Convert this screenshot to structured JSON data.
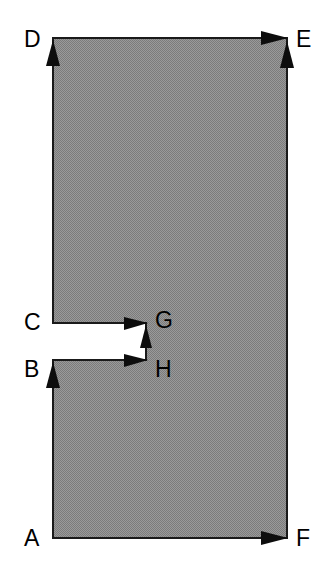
{
  "figure": {
    "type": "geometry-diagram",
    "canvas": {
      "width": 333,
      "height": 573
    },
    "colors": {
      "fill": "#8c8c8c",
      "stroke": "#1a1a1a",
      "background": "#ffffff",
      "label": "#000000"
    },
    "stroke_width": 2,
    "outline": {
      "description": "Rectangle A-D-E-F with a rectangular notch cut into the left side between C and B, reaching rightwards to G and H.",
      "path_points": [
        {
          "name": "A",
          "x": 53,
          "y": 538
        },
        {
          "name": "D",
          "x": 53,
          "y": 38
        },
        {
          "name": "E",
          "x": 287,
          "y": 38
        },
        {
          "name": "F",
          "x": 287,
          "y": 538
        },
        {
          "name": "C",
          "x": 53,
          "y": 323
        },
        {
          "name": "G",
          "x": 146,
          "y": 323
        },
        {
          "name": "H",
          "x": 146,
          "y": 360
        },
        {
          "name": "B",
          "x": 53,
          "y": 360
        }
      ],
      "svg_path": "M 53 538 L 53 360 L 146 360 L 146 323 L 53 323 L 53 38 L 287 38 L 287 538 Z"
    },
    "vertex_labels": [
      {
        "id": "D",
        "text": "D",
        "x": 24,
        "y": 28
      },
      {
        "id": "E",
        "text": "E",
        "x": 296,
        "y": 28
      },
      {
        "id": "C",
        "text": "C",
        "x": 24,
        "y": 311
      },
      {
        "id": "G",
        "text": "G",
        "x": 155,
        "y": 309
      },
      {
        "id": "B",
        "text": "B",
        "x": 24,
        "y": 358
      },
      {
        "id": "H",
        "text": "H",
        "x": 155,
        "y": 358
      },
      {
        "id": "A",
        "text": "A",
        "x": 24,
        "y": 527
      },
      {
        "id": "F",
        "text": "F",
        "x": 296,
        "y": 527
      }
    ],
    "arrowheads": [
      {
        "id": "arrow-A-to-D",
        "at_vertex": "D",
        "direction": "up",
        "tip_x": 53,
        "tip_y": 40,
        "description": "left edge travelling upward from A to D"
      },
      {
        "id": "arrow-D-to-E",
        "at_vertex": "E",
        "direction": "right",
        "tip_x": 287,
        "tip_y": 38,
        "description": "top edge travelling rightward from D to E"
      },
      {
        "id": "arrow-F-to-E",
        "at_vertex": "E",
        "direction": "up",
        "tip_x": 287,
        "tip_y": 42,
        "description": "right edge travelling upward from F to E"
      },
      {
        "id": "arrow-C-to-G",
        "at_vertex": "G",
        "direction": "right",
        "tip_x": 147,
        "tip_y": 323,
        "description": "notch upper edge travelling rightward from C to G"
      },
      {
        "id": "arrow-H-to-G",
        "at_vertex": "G",
        "direction": "up",
        "tip_x": 146,
        "tip_y": 326,
        "description": "notch right edge travelling upward from H to G"
      },
      {
        "id": "arrow-B-to-H",
        "at_vertex": "H",
        "direction": "right",
        "tip_x": 147,
        "tip_y": 360,
        "description": "notch lower edge travelling rightward from B to H"
      },
      {
        "id": "arrow-A-to-B",
        "at_vertex": "B",
        "direction": "up",
        "tip_x": 53,
        "tip_y": 362,
        "description": "left lower edge travelling upward from A to B"
      },
      {
        "id": "arrow-A-to-F",
        "at_vertex": "F",
        "direction": "right",
        "tip_x": 287,
        "tip_y": 538,
        "description": "bottom edge travelling rightward from A to F"
      }
    ]
  }
}
